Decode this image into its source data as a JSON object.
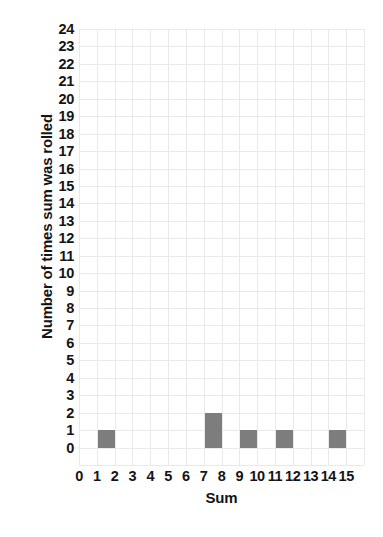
{
  "chart_data": {
    "type": "bar",
    "title": "",
    "xlabel": "Sum",
    "ylabel": "Number of times sum was rolled",
    "categories": [
      0,
      1,
      2,
      3,
      4,
      5,
      6,
      7,
      8,
      9,
      10,
      11,
      12,
      13,
      14,
      15
    ],
    "values": [
      0,
      1,
      0,
      0,
      0,
      0,
      0,
      2,
      0,
      1,
      0,
      1,
      0,
      0,
      1,
      0
    ],
    "xtick_labels": [
      "0",
      "1",
      "2",
      "3",
      "4",
      "5",
      "6",
      "7",
      "8",
      "9",
      "10",
      "11",
      "12",
      "13",
      "14",
      "15"
    ],
    "ytick_labels": [
      "24",
      "23",
      "22",
      "21",
      "20",
      "19",
      "18",
      "17",
      "16",
      "15",
      "14",
      "13",
      "12",
      "11",
      "10",
      "9",
      "8",
      "7",
      "6",
      "5",
      "4",
      "3",
      "2",
      "1",
      "0"
    ],
    "xlim": [
      0,
      15
    ],
    "ylim": [
      0,
      24
    ],
    "grid": true,
    "legend": null,
    "bar_color": "#7d7d7d",
    "grid_color": "#e9e9e9",
    "text_color": "#141414",
    "background_color": "#ffffff",
    "bars": [
      {
        "category": "1",
        "value": 1
      },
      {
        "category": "7",
        "value": 2
      },
      {
        "category": "9",
        "value": 1
      },
      {
        "category": "11",
        "value": 1
      },
      {
        "category": "14",
        "value": 1
      }
    ]
  }
}
